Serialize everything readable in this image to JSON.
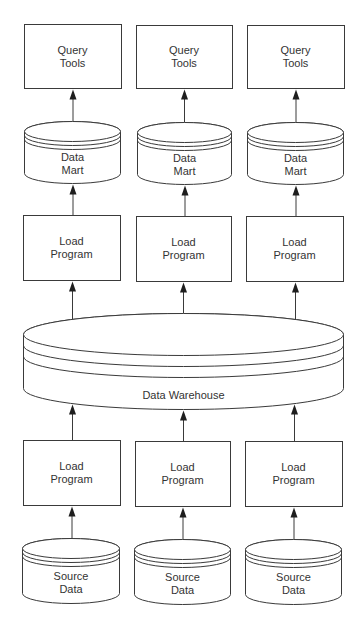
{
  "diagram": {
    "colors": {
      "stroke": "#3a3a3a",
      "arrow": "#1e1e1e",
      "text": "#333333",
      "fill": "#ffffff",
      "background": "#ffffff"
    },
    "query_tools": [
      {
        "id": "query-tools-1",
        "lines": [
          "Query",
          "Tools"
        ],
        "x": 24,
        "y": 24,
        "w": 97,
        "h": 64
      },
      {
        "id": "query-tools-2",
        "lines": [
          "Query",
          "Tools"
        ],
        "x": 136,
        "y": 25,
        "w": 96,
        "h": 63
      },
      {
        "id": "query-tools-3",
        "lines": [
          "Query",
          "Tools"
        ],
        "x": 247,
        "y": 25,
        "w": 97,
        "h": 63
      }
    ],
    "data_marts": [
      {
        "id": "data-mart-1",
        "lines": [
          "Data",
          "Mart"
        ],
        "x": 24,
        "y": 121,
        "w": 96,
        "h": 62
      },
      {
        "id": "data-mart-2",
        "lines": [
          "Data",
          "Mart"
        ],
        "x": 137,
        "y": 122,
        "w": 94,
        "h": 62
      },
      {
        "id": "data-mart-3",
        "lines": [
          "Data",
          "Mart"
        ],
        "x": 247,
        "y": 122,
        "w": 96,
        "h": 62
      }
    ],
    "upper_load_programs": [
      {
        "id": "upper-load-program-1",
        "lines": [
          "Load",
          "Program"
        ],
        "x": 23,
        "y": 215,
        "w": 97,
        "h": 65
      },
      {
        "id": "upper-load-program-2",
        "lines": [
          "Load",
          "Program"
        ],
        "x": 136,
        "y": 216,
        "w": 95,
        "h": 65
      },
      {
        "id": "upper-load-program-3",
        "lines": [
          "Load",
          "Program"
        ],
        "x": 246,
        "y": 216,
        "w": 97,
        "h": 65
      }
    ],
    "warehouse": {
      "id": "data-warehouse",
      "label": "Data Warehouse",
      "x": 23,
      "y": 313,
      "w": 320,
      "h": 96
    },
    "lower_load_programs": [
      {
        "id": "lower-load-program-1",
        "lines": [
          "Load",
          "Program"
        ],
        "x": 23,
        "y": 440,
        "w": 97,
        "h": 65
      },
      {
        "id": "lower-load-program-2",
        "lines": [
          "Load",
          "Program"
        ],
        "x": 135,
        "y": 441,
        "w": 95,
        "h": 65
      },
      {
        "id": "lower-load-program-3",
        "lines": [
          "Load",
          "Program"
        ],
        "x": 245,
        "y": 441,
        "w": 97,
        "h": 65
      }
    ],
    "source_data": [
      {
        "id": "source-data-1",
        "lines": [
          "Source",
          "Data"
        ],
        "x": 22,
        "y": 538,
        "w": 97,
        "h": 65
      },
      {
        "id": "source-data-2",
        "lines": [
          "Source",
          "Data"
        ],
        "x": 134,
        "y": 539,
        "w": 96,
        "h": 65
      },
      {
        "id": "source-data-3",
        "lines": [
          "Source",
          "Data"
        ],
        "x": 245,
        "y": 539,
        "w": 96,
        "h": 65
      }
    ],
    "arrows": [
      {
        "from": "data-mart-1",
        "to": "query-tools-1"
      },
      {
        "from": "data-mart-2",
        "to": "query-tools-2"
      },
      {
        "from": "data-mart-3",
        "to": "query-tools-3"
      },
      {
        "from": "upper-load-program-1",
        "to": "data-mart-1"
      },
      {
        "from": "upper-load-program-2",
        "to": "data-mart-2"
      },
      {
        "from": "upper-load-program-3",
        "to": "data-mart-3"
      },
      {
        "from": "data-warehouse",
        "to": "upper-load-program-1",
        "x": 72
      },
      {
        "from": "data-warehouse",
        "to": "upper-load-program-2",
        "x": 183
      },
      {
        "from": "data-warehouse",
        "to": "upper-load-program-3",
        "x": 295
      },
      {
        "from": "lower-load-program-1",
        "to": "data-warehouse",
        "x": 72
      },
      {
        "from": "lower-load-program-2",
        "to": "data-warehouse",
        "x": 183
      },
      {
        "from": "lower-load-program-3",
        "to": "data-warehouse",
        "x": 294
      },
      {
        "from": "source-data-1",
        "to": "lower-load-program-1"
      },
      {
        "from": "source-data-2",
        "to": "lower-load-program-2"
      },
      {
        "from": "source-data-3",
        "to": "lower-load-program-3"
      }
    ]
  }
}
